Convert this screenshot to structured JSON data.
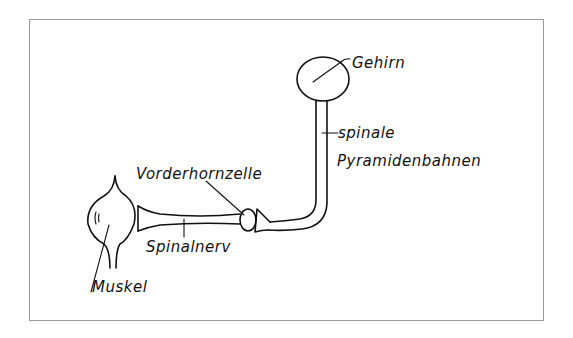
{
  "diagram": {
    "title": "",
    "frame": {
      "border_color": "#9a9a9a",
      "background": "#ffffff"
    },
    "line_color": "#111111",
    "labels": {
      "brain": "Gehirn",
      "pyramidal_tracts_line1": "spinale",
      "pyramidal_tracts_line2": "Pyramidenbahnen",
      "anterior_horn_cell": "Vorderhornzelle",
      "spinal_nerve": "Spinalnerv",
      "muscle": "Muskel"
    },
    "nodes": [
      {
        "id": "brain",
        "label": "Gehirn",
        "shape": "circle"
      },
      {
        "id": "pyramidal_tracts",
        "label": "spinale Pyramidenbahnen",
        "shape": "tube"
      },
      {
        "id": "anterior_horn_cell",
        "label": "Vorderhornzelle",
        "shape": "oval"
      },
      {
        "id": "spinal_nerve",
        "label": "Spinalnerv",
        "shape": "tube"
      },
      {
        "id": "muscle",
        "label": "Muskel",
        "shape": "bulb"
      }
    ],
    "edges": [
      {
        "from": "brain",
        "to": "pyramidal_tracts"
      },
      {
        "from": "pyramidal_tracts",
        "to": "anterior_horn_cell"
      },
      {
        "from": "anterior_horn_cell",
        "to": "spinal_nerve"
      },
      {
        "from": "spinal_nerve",
        "to": "muscle"
      }
    ]
  }
}
